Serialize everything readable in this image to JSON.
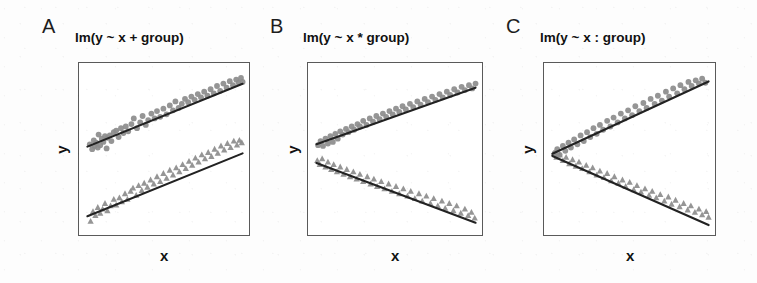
{
  "figure": {
    "width": 757,
    "height": 283,
    "background_color": "#fdfdfd",
    "marker_color": "#8c8c8c",
    "line_color": "#222222",
    "frame_color": "#5a5a5a",
    "axis_label_x": "x",
    "axis_label_y": "y"
  },
  "panels": [
    {
      "letter": "A",
      "title": "lm(y ~ x + group)",
      "xlabel": "x",
      "ylabel": "y"
    },
    {
      "letter": "B",
      "title": "lm(y ~ x * group)",
      "xlabel": "x",
      "ylabel": "y"
    },
    {
      "letter": "C",
      "title": "lm(y ~ x : group)",
      "xlabel": "x",
      "ylabel": "y"
    }
  ],
  "chart_data": [
    {
      "type": "scatter",
      "panel": "A",
      "title": "lm(y ~ x + group)",
      "xlabel": "x",
      "ylabel": "y",
      "xlim": [
        0,
        10
      ],
      "ylim": [
        0,
        10
      ],
      "grid": false,
      "legend": "none",
      "axis_ticks": false,
      "series": [
        {
          "name": "group 1",
          "marker": "circle",
          "color": "#8c8c8c",
          "fit_line": {
            "intercept": 5.15,
            "slope": 0.4,
            "color": "#222222"
          },
          "x": [
            0.3,
            0.45,
            0.55,
            0.6,
            0.7,
            0.8,
            0.85,
            0.95,
            1.05,
            1.15,
            1.25,
            1.35,
            1.4,
            1.55,
            1.65,
            1.8,
            1.95,
            2.1,
            2.25,
            2.4,
            2.55,
            2.7,
            2.9,
            3.05,
            3.25,
            3.45,
            3.6,
            3.8,
            3.95,
            4.15,
            4.35,
            4.5,
            4.7,
            4.9,
            5.1,
            5.3,
            5.5,
            5.65,
            5.85,
            6.05,
            6.25,
            6.45,
            6.65,
            6.85,
            7.05,
            7.25,
            7.45,
            7.65,
            7.85,
            8.05,
            8.25,
            8.45,
            8.65,
            8.85,
            9.05,
            9.25,
            9.45,
            9.6,
            9.75,
            9.85
          ],
          "y": [
            5.35,
            5.05,
            5.6,
            5.25,
            5.45,
            5.15,
            5.95,
            5.3,
            5.7,
            5.5,
            5.85,
            5.1,
            5.75,
            5.9,
            5.55,
            6.1,
            6.2,
            5.8,
            6.35,
            6.05,
            6.45,
            6.15,
            6.6,
            6.95,
            6.35,
            6.7,
            7.1,
            6.55,
            6.85,
            7.25,
            6.95,
            7.4,
            7.05,
            7.55,
            7.2,
            7.75,
            7.45,
            8.0,
            7.6,
            7.85,
            8.15,
            7.95,
            8.3,
            8.1,
            8.45,
            8.25,
            8.6,
            8.35,
            8.75,
            8.5,
            8.95,
            8.65,
            9.1,
            8.85,
            9.25,
            9.0,
            9.35,
            9.15,
            9.45,
            9.2
          ]
        },
        {
          "name": "group 2",
          "marker": "triangle",
          "color": "#8c8c8c",
          "fit_line": {
            "intercept": 0.85,
            "slope": 0.4,
            "color": "#222222"
          },
          "x": [
            0.35,
            0.5,
            0.65,
            0.8,
            0.95,
            1.1,
            1.25,
            1.4,
            1.6,
            1.8,
            1.95,
            2.15,
            2.3,
            2.5,
            2.65,
            2.85,
            3.0,
            3.2,
            3.35,
            3.55,
            3.7,
            3.9,
            4.1,
            4.3,
            4.5,
            4.7,
            4.9,
            5.1,
            5.3,
            5.5,
            5.7,
            5.9,
            6.1,
            6.3,
            6.5,
            6.7,
            6.9,
            7.1,
            7.3,
            7.5,
            7.7,
            7.9,
            8.1,
            8.3,
            8.5,
            8.7,
            8.9,
            9.1,
            9.3,
            9.5,
            9.65,
            9.8
          ],
          "y": [
            0.6,
            1.2,
            0.95,
            1.45,
            1.1,
            1.35,
            1.7,
            1.25,
            1.55,
            1.95,
            1.6,
            2.05,
            1.8,
            2.3,
            1.95,
            2.45,
            2.65,
            2.2,
            2.8,
            2.5,
            2.95,
            2.7,
            3.15,
            2.9,
            3.35,
            3.05,
            3.55,
            3.25,
            3.75,
            3.45,
            3.9,
            3.65,
            4.1,
            3.85,
            4.3,
            4.05,
            4.5,
            4.25,
            4.7,
            4.45,
            4.85,
            4.6,
            5.05,
            4.8,
            5.25,
            5.0,
            5.4,
            5.15,
            5.55,
            5.3,
            5.6,
            5.45
          ]
        }
      ]
    },
    {
      "type": "scatter",
      "panel": "B",
      "title": "lm(y ~ x * group)",
      "xlabel": "x",
      "ylabel": "y",
      "xlim": [
        0,
        10
      ],
      "ylim": [
        0,
        10
      ],
      "grid": false,
      "legend": "none",
      "axis_ticks": false,
      "series": [
        {
          "name": "group 1",
          "marker": "circle",
          "color": "#8c8c8c",
          "fit_line": {
            "intercept": 5.3,
            "slope": 0.36,
            "color": "#222222"
          },
          "x": [
            0.25,
            0.4,
            0.55,
            0.7,
            0.85,
            1.0,
            1.15,
            1.3,
            1.45,
            1.6,
            1.75,
            1.95,
            2.1,
            2.3,
            2.45,
            2.65,
            2.8,
            3.0,
            3.2,
            3.4,
            3.6,
            3.8,
            4.0,
            4.2,
            4.4,
            4.6,
            4.8,
            5.0,
            5.2,
            5.4,
            5.6,
            5.85,
            6.05,
            6.3,
            6.5,
            6.75,
            6.95,
            7.2,
            7.4,
            7.65,
            7.85,
            8.1,
            8.3,
            8.55,
            8.75,
            9.0,
            9.2,
            9.45,
            9.65,
            9.85
          ],
          "y": [
            5.3,
            5.55,
            5.25,
            5.7,
            5.4,
            5.85,
            5.5,
            6.0,
            5.7,
            6.15,
            5.95,
            6.3,
            6.1,
            6.45,
            6.25,
            6.6,
            6.45,
            6.8,
            6.55,
            6.95,
            6.75,
            7.1,
            6.9,
            7.25,
            7.05,
            7.4,
            7.2,
            7.55,
            7.35,
            7.7,
            7.5,
            7.85,
            7.65,
            8.0,
            7.8,
            8.15,
            7.95,
            8.3,
            8.1,
            8.45,
            8.25,
            8.6,
            8.4,
            8.75,
            8.55,
            8.9,
            8.7,
            9.0,
            8.8,
            9.1
          ]
        },
        {
          "name": "group 2",
          "marker": "triangle",
          "color": "#8c8c8c",
          "fit_line": {
            "intercept": 4.25,
            "slope": -0.38,
            "color": "#222222"
          },
          "x": [
            0.2,
            0.35,
            0.5,
            0.7,
            0.85,
            1.05,
            1.2,
            1.4,
            1.6,
            1.8,
            2.0,
            2.2,
            2.4,
            2.6,
            2.8,
            3.0,
            3.25,
            3.45,
            3.65,
            3.85,
            4.1,
            4.3,
            4.55,
            4.75,
            5.0,
            5.2,
            5.45,
            5.7,
            5.9,
            6.15,
            6.4,
            6.6,
            6.85,
            7.1,
            7.3,
            7.55,
            7.8,
            8.0,
            8.25,
            8.5,
            8.7,
            8.95,
            9.2,
            9.4,
            9.6,
            9.8
          ],
          "y": [
            4.35,
            4.1,
            4.45,
            3.95,
            4.25,
            3.8,
            4.1,
            3.65,
            3.95,
            3.5,
            3.8,
            3.35,
            3.65,
            3.2,
            3.5,
            3.05,
            3.35,
            2.9,
            3.2,
            2.75,
            3.05,
            2.6,
            2.9,
            2.45,
            2.75,
            2.3,
            2.6,
            2.15,
            2.45,
            2.0,
            2.3,
            1.85,
            2.15,
            1.7,
            2.0,
            1.55,
            1.85,
            1.4,
            1.7,
            1.25,
            1.55,
            1.1,
            1.35,
            0.95,
            1.15,
            0.8
          ]
        }
      ]
    },
    {
      "type": "scatter",
      "panel": "C",
      "title": "lm(y ~ x : group)",
      "xlabel": "x",
      "ylabel": "y",
      "xlim": [
        0,
        10
      ],
      "ylim": [
        0,
        10
      ],
      "grid": false,
      "legend": "none",
      "axis_ticks": false,
      "note": "Both fit lines share a common intercept at the left edge and diverge",
      "series": [
        {
          "name": "group 1",
          "marker": "circle",
          "color": "#8c8c8c",
          "fit_line": {
            "intercept": 4.7,
            "slope": 0.46,
            "color": "#222222"
          },
          "x": [
            0.3,
            0.45,
            0.6,
            0.8,
            0.95,
            1.15,
            1.3,
            1.5,
            1.7,
            1.9,
            2.1,
            2.3,
            2.5,
            2.7,
            2.9,
            3.1,
            3.3,
            3.55,
            3.75,
            3.95,
            4.2,
            4.4,
            4.65,
            4.85,
            5.1,
            5.3,
            5.55,
            5.8,
            6.0,
            6.25,
            6.5,
            6.7,
            6.95,
            7.2,
            7.4,
            7.65,
            7.9,
            8.1,
            8.35,
            8.6,
            8.8,
            9.05,
            9.25,
            9.45,
            9.65
          ],
          "y": [
            4.8,
            5.05,
            4.7,
            5.25,
            4.95,
            5.45,
            5.15,
            5.65,
            5.35,
            5.9,
            5.55,
            6.1,
            5.8,
            6.35,
            6.0,
            6.55,
            6.25,
            6.8,
            6.45,
            7.0,
            6.7,
            7.25,
            6.95,
            7.45,
            7.15,
            7.7,
            7.4,
            7.9,
            7.6,
            8.15,
            7.85,
            8.35,
            8.05,
            8.6,
            8.3,
            8.8,
            8.5,
            9.0,
            8.75,
            9.2,
            8.95,
            9.3,
            9.1,
            9.4,
            9.15
          ]
        },
        {
          "name": "group 2",
          "marker": "triangle",
          "color": "#8c8c8c",
          "fit_line": {
            "intercept": 4.7,
            "slope": -0.44,
            "color": "#222222"
          },
          "x": [
            0.25,
            0.4,
            0.6,
            0.8,
            1.0,
            1.2,
            1.4,
            1.6,
            1.8,
            2.0,
            2.25,
            2.45,
            2.65,
            2.9,
            3.1,
            3.35,
            3.55,
            3.8,
            4.0,
            4.25,
            4.5,
            4.7,
            4.95,
            5.2,
            5.4,
            5.65,
            5.9,
            6.15,
            6.35,
            6.6,
            6.85,
            7.1,
            7.35,
            7.55,
            7.8,
            8.05,
            8.3,
            8.55,
            8.75,
            9.0,
            9.25,
            9.45,
            9.7,
            9.85
          ],
          "y": [
            4.8,
            4.55,
            4.7,
            4.35,
            4.55,
            4.15,
            4.4,
            4.0,
            4.25,
            3.85,
            4.05,
            3.65,
            3.9,
            3.45,
            3.7,
            3.3,
            3.55,
            3.1,
            3.35,
            2.95,
            3.15,
            2.75,
            3.0,
            2.55,
            2.8,
            2.4,
            2.6,
            2.2,
            2.45,
            2.05,
            2.25,
            1.85,
            2.1,
            1.65,
            1.9,
            1.5,
            1.7,
            1.3,
            1.55,
            1.15,
            1.35,
            1.0,
            1.2,
            0.85
          ]
        }
      ]
    }
  ]
}
